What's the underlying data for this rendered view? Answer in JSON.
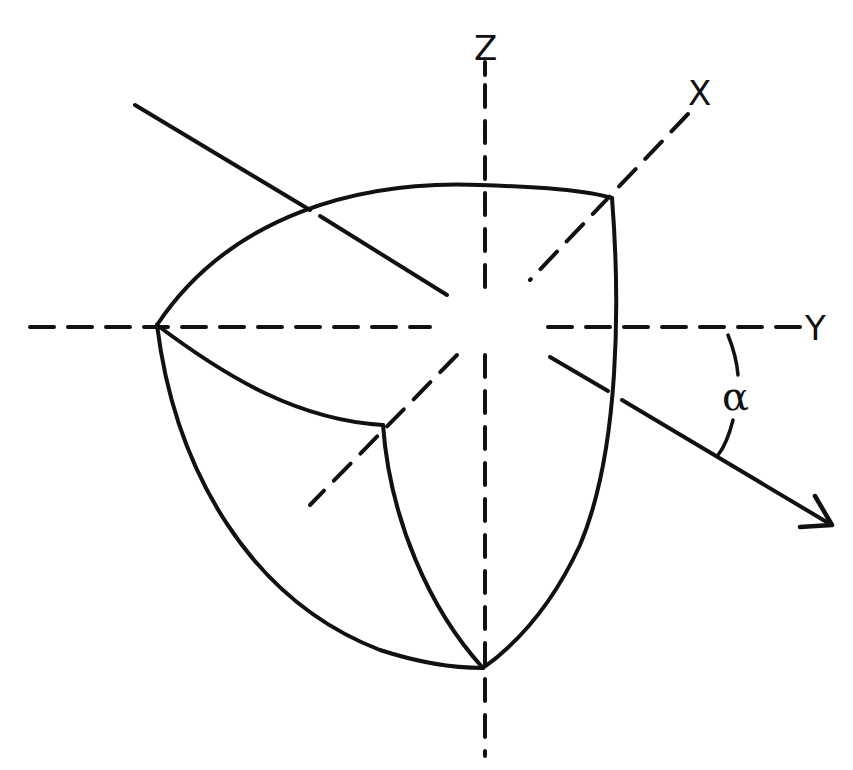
{
  "diagram": {
    "colors": {
      "background": "#ffffff",
      "ink": "#111111"
    },
    "labels": {
      "z_axis": "Z",
      "x_axis": "X",
      "y_axis": "Y",
      "angle": "α"
    },
    "axes": {
      "z": {
        "x1": 485,
        "y1": 85,
        "x2": 485,
        "y2": 755,
        "style": "dashed"
      },
      "y": {
        "x1": 30,
        "y1": 327,
        "x2": 800,
        "y2": 327,
        "style": "dashed"
      },
      "x": {
        "x1": 690,
        "y1": 112,
        "x2": 310,
        "y2": 505,
        "style": "dashed"
      }
    },
    "rotated_axis": {
      "x1": 135,
      "y1": 105,
      "x2": 830,
      "y2": 525,
      "style": "solid",
      "arrow_end": true
    },
    "solid_vertices": {
      "left": [
        157,
        325
      ],
      "top_right": [
        612,
        198
      ],
      "inner": [
        383,
        425
      ],
      "bottom": [
        483,
        668
      ]
    },
    "angle_arc": {
      "label": "α",
      "between": [
        "Y axis",
        "rotated axis"
      ]
    }
  }
}
